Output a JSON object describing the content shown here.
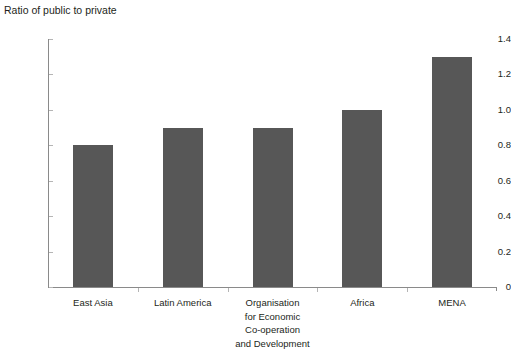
{
  "chart_data": {
    "type": "bar",
    "title": "Ratio of public to private",
    "xlabel": "",
    "ylabel": "Ratio of public to private",
    "categories": [
      "East Asia",
      "Latin America",
      "Organisation\nfor Economic\nCo-operation\nand Development",
      "Africa",
      "MENA"
    ],
    "values": [
      0.8,
      0.9,
      0.9,
      1.0,
      1.3
    ],
    "ylim": [
      0,
      1.4
    ],
    "ytick_labels": [
      "0",
      "0.2",
      "0.4",
      "0.6",
      "0.8",
      "1.0",
      "1.2",
      "1.4"
    ],
    "ytick_values": [
      0,
      0.2,
      0.4,
      0.6,
      0.8,
      1.0,
      1.2,
      1.4
    ],
    "grid": false,
    "legend": "none",
    "bar_color": "#575757",
    "axis_color": "#8a8a8a",
    "text_color": "#231f20"
  }
}
